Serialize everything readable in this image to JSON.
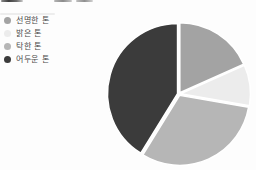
{
  "artifacts": {
    "cropped_heading": "bottom edge of a larger heading cut off by the top of the screenshot (no readable text)"
  },
  "chart_data": {
    "type": "pie",
    "title": "",
    "legend_position": "top-left",
    "start_angle_deg": 0,
    "direction": "clockwise",
    "unit": "percent",
    "series": [
      {
        "label": "선명한 톤",
        "value": 18.3,
        "color": "#a3a3a3"
      },
      {
        "label": "밝은 톤",
        "value": 9.4,
        "color": "#ececec"
      },
      {
        "label": "탁한 톤",
        "value": 31.1,
        "color": "#b6b6b6"
      },
      {
        "label": "어두운 톤",
        "value": 41.2,
        "color": "#3b3b3b"
      }
    ]
  }
}
